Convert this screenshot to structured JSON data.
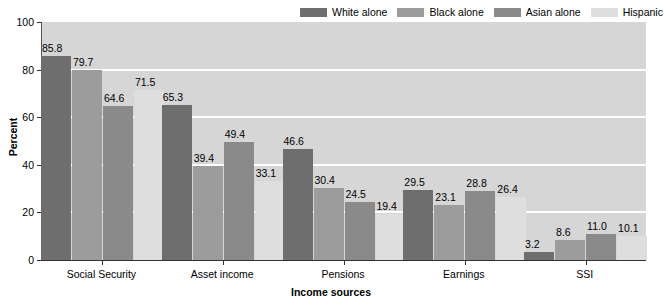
{
  "chart_data": {
    "type": "bar",
    "title": "",
    "xlabel": "Income sources",
    "ylabel": "Percent",
    "ylim": [
      0,
      100
    ],
    "yticks": [
      0,
      20,
      40,
      60,
      80,
      100
    ],
    "ytick_labels": [
      "0",
      "20",
      "40",
      "60",
      "80",
      "100"
    ],
    "grid": true,
    "legend_position": "top-right",
    "categories": [
      "Social Security",
      "Asset income",
      "Pensions",
      "Earnings",
      "SSI"
    ],
    "series": [
      {
        "name": "White alone",
        "color": "#6e6e6e",
        "values": [
          85.8,
          65.3,
          46.6,
          29.5,
          3.2
        ],
        "labels": [
          "85.8",
          "65.3",
          "46.6",
          "29.5",
          "3.2"
        ]
      },
      {
        "name": "Black alone",
        "color": "#9c9c9c",
        "values": [
          79.7,
          39.4,
          30.4,
          23.1,
          8.6
        ],
        "labels": [
          "79.7",
          "39.4",
          "30.4",
          "23.1",
          "8.6"
        ]
      },
      {
        "name": "Asian alone",
        "color": "#8a8a8a",
        "values": [
          64.6,
          49.4,
          24.5,
          28.8,
          11.0
        ],
        "labels": [
          "64.6",
          "49.4",
          "24.5",
          "28.8",
          "11.0"
        ]
      },
      {
        "name": "Hispanic",
        "color": "#dedede",
        "values": [
          71.5,
          33.1,
          19.4,
          26.4,
          10.1
        ],
        "labels": [
          "71.5",
          "33.1",
          "19.4",
          "26.4",
          "10.1"
        ]
      }
    ],
    "plot_background": "#d6d6d6",
    "gridline_color": "#ffffff"
  },
  "legend": {
    "items": [
      {
        "label": "White alone"
      },
      {
        "label": "Black alone"
      },
      {
        "label": "Asian alone"
      },
      {
        "label": "Hispanic"
      }
    ]
  },
  "axes": {
    "y_title": "Percent",
    "x_title": "Income sources"
  }
}
